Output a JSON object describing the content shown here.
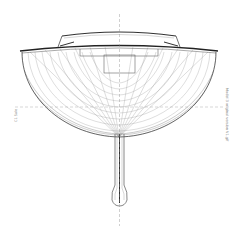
{
  "drawing": {
    "subject": "sailboat hull body plan (front view) with fin keel and bulb",
    "left_label": "C1 Sale",
    "right_label": "Model 3 original version V1.gif",
    "line_color": "#333333",
    "grid_color": "#9a9a9a",
    "centerline_color": "#888888"
  }
}
